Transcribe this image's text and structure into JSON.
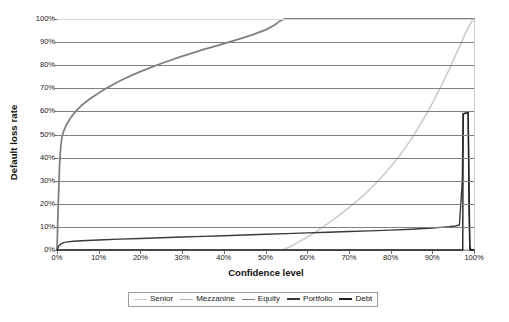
{
  "chart_data": {
    "type": "line",
    "title": "",
    "xlabel": "Confidence level",
    "ylabel": "Default loss rate",
    "xlim": [
      0,
      100
    ],
    "ylim": [
      0,
      100
    ],
    "grid": "horizontal",
    "legend_position": "bottom",
    "x_ticks": [
      "0%",
      "10%",
      "20%",
      "30%",
      "40%",
      "50%",
      "60%",
      "70%",
      "80%",
      "90%",
      "100%"
    ],
    "y_ticks": [
      "0%",
      "10%",
      "20%",
      "30%",
      "40%",
      "50%",
      "60%",
      "70%",
      "80%",
      "90%",
      "100%"
    ],
    "x_tick_values": [
      0,
      10,
      20,
      30,
      40,
      50,
      60,
      70,
      80,
      90,
      100
    ],
    "y_tick_values": [
      0,
      10,
      20,
      30,
      40,
      50,
      60,
      70,
      80,
      90,
      100
    ],
    "series": [
      {
        "name": "Senior",
        "color": "#cccccc",
        "width": 1.6,
        "points": [
          [
            0,
            0
          ],
          [
            10,
            0
          ],
          [
            20,
            0
          ],
          [
            30,
            0
          ],
          [
            40,
            0
          ],
          [
            50,
            0
          ],
          [
            54,
            0
          ],
          [
            56,
            1.5
          ],
          [
            58,
            3.5
          ],
          [
            60,
            5.5
          ],
          [
            62,
            7.8
          ],
          [
            64,
            10.2
          ],
          [
            66,
            12.8
          ],
          [
            68,
            15.5
          ],
          [
            70,
            18.3
          ],
          [
            72,
            21.3
          ],
          [
            74,
            24.5
          ],
          [
            76,
            28.0
          ],
          [
            78,
            31.8
          ],
          [
            80,
            36.0
          ],
          [
            82,
            40.5
          ],
          [
            84,
            45.5
          ],
          [
            86,
            51.0
          ],
          [
            88,
            57.0
          ],
          [
            90,
            63.5
          ],
          [
            92,
            70.5
          ],
          [
            94,
            78.0
          ],
          [
            95,
            82.0
          ],
          [
            96,
            86.0
          ],
          [
            97,
            90.0
          ],
          [
            98,
            94.0
          ],
          [
            99,
            97.5
          ],
          [
            99.5,
            99.0
          ],
          [
            100,
            100
          ]
        ]
      },
      {
        "name": "Mezzanine",
        "color": "#b4b4b4",
        "width": 1.5,
        "points": [
          [
            0,
            0
          ],
          [
            20,
            0
          ],
          [
            40,
            0
          ],
          [
            60,
            0
          ],
          [
            80,
            0
          ],
          [
            95,
            0
          ],
          [
            100,
            0
          ]
        ]
      },
      {
        "name": "Equity",
        "color": "#808080",
        "width": 1.8,
        "points": [
          [
            0,
            0
          ],
          [
            0.3,
            20
          ],
          [
            0.6,
            36
          ],
          [
            0.9,
            45
          ],
          [
            1.2,
            49
          ],
          [
            1.6,
            51.5
          ],
          [
            2.2,
            54
          ],
          [
            3,
            56.5
          ],
          [
            4,
            59
          ],
          [
            5,
            61
          ],
          [
            6,
            62.8
          ],
          [
            8,
            65.6
          ],
          [
            10,
            68
          ],
          [
            12,
            70.2
          ],
          [
            14,
            72.2
          ],
          [
            16,
            74
          ],
          [
            18,
            75.7
          ],
          [
            20,
            77.2
          ],
          [
            23,
            79.4
          ],
          [
            26,
            81.4
          ],
          [
            29,
            83.3
          ],
          [
            32,
            85.0
          ],
          [
            35,
            86.7
          ],
          [
            38,
            88.3
          ],
          [
            41,
            89.9
          ],
          [
            44,
            91.5
          ],
          [
            47,
            93.2
          ],
          [
            50,
            95.3
          ],
          [
            52,
            97.2
          ],
          [
            53.5,
            99.2
          ],
          [
            54.5,
            100
          ],
          [
            60,
            100
          ],
          [
            70,
            100
          ],
          [
            80,
            100
          ],
          [
            90,
            100
          ],
          [
            97,
            100
          ],
          [
            100,
            100
          ]
        ]
      },
      {
        "name": "Portfolio",
        "color": "#3a3a3a",
        "width": 1.4,
        "points": [
          [
            0,
            0
          ],
          [
            0.4,
            1.6
          ],
          [
            0.9,
            2.6
          ],
          [
            1.6,
            3.2
          ],
          [
            2.5,
            3.5
          ],
          [
            4,
            3.8
          ],
          [
            6,
            4.0
          ],
          [
            10,
            4.3
          ],
          [
            15,
            4.7
          ],
          [
            20,
            5.0
          ],
          [
            25,
            5.3
          ],
          [
            30,
            5.6
          ],
          [
            35,
            5.9
          ],
          [
            40,
            6.2
          ],
          [
            45,
            6.5
          ],
          [
            50,
            6.8
          ],
          [
            55,
            7.1
          ],
          [
            60,
            7.4
          ],
          [
            65,
            7.7
          ],
          [
            70,
            8.0
          ],
          [
            75,
            8.3
          ],
          [
            80,
            8.6
          ],
          [
            85,
            9.0
          ],
          [
            88,
            9.3
          ],
          [
            90,
            9.5
          ],
          [
            92,
            9.8
          ],
          [
            94,
            10.1
          ],
          [
            95.5,
            10.4
          ],
          [
            96.5,
            10.8
          ],
          [
            97.2,
            30
          ],
          [
            97.4,
            59
          ],
          [
            98.6,
            59.5
          ],
          [
            98.8,
            30
          ],
          [
            99,
            1.5
          ],
          [
            99.3,
            0
          ],
          [
            100,
            0
          ]
        ]
      },
      {
        "name": "Debt",
        "color": "#222222",
        "width": 1.4,
        "points": [
          [
            0,
            0
          ],
          [
            10,
            0
          ],
          [
            20,
            0
          ],
          [
            30,
            0
          ],
          [
            40,
            0
          ],
          [
            50,
            0
          ],
          [
            60,
            0
          ],
          [
            70,
            0
          ],
          [
            80,
            0
          ],
          [
            90,
            0
          ],
          [
            95,
            0
          ],
          [
            97,
            0
          ],
          [
            97.3,
            0
          ],
          [
            97.4,
            59
          ],
          [
            98.6,
            59.5
          ],
          [
            98.8,
            20
          ],
          [
            99,
            0
          ],
          [
            100,
            0
          ]
        ]
      }
    ]
  },
  "axes": {
    "y_title": "Default loss rate",
    "x_title": "Confidence level"
  },
  "legend": {
    "entries": [
      {
        "label": "Senior",
        "color": "#cccccc",
        "thickness": "1.5px"
      },
      {
        "label": "Mezzanine",
        "color": "#b4b4b4",
        "thickness": "1.5px"
      },
      {
        "label": "Equity",
        "color": "#808080",
        "thickness": "1.8px"
      },
      {
        "label": "Portfolio",
        "color": "#3a3a3a",
        "thickness": "2px"
      },
      {
        "label": "Debt",
        "color": "#222222",
        "thickness": "2px"
      }
    ]
  }
}
